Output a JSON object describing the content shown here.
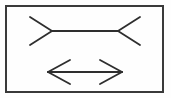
{
  "figure": {
    "background_color": "#fefefe",
    "frame": {
      "label": "rectangular border frame",
      "x": 6,
      "y": 6,
      "width": 157,
      "height": 86,
      "stroke_color": "#3a3a3a",
      "stroke_width": 2
    },
    "stroke_color": "#2e2e2e",
    "stroke_width": 1.8,
    "shapes": [
      {
        "name": "top-line-outward-fins",
        "description": "Horizontal line with fins pointing outward at both ends, appears shorter",
        "shaft": {
          "x1": 52,
          "y1": 31,
          "x2": 118,
          "y2": 31
        },
        "fins": [
          {
            "x1": 52,
            "y1": 31,
            "x2": 30,
            "y2": 17
          },
          {
            "x1": 52,
            "y1": 31,
            "x2": 30,
            "y2": 45
          },
          {
            "x1": 118,
            "y1": 31,
            "x2": 140,
            "y2": 17
          },
          {
            "x1": 118,
            "y1": 31,
            "x2": 140,
            "y2": 45
          }
        ]
      },
      {
        "name": "bottom-line-inward-fins",
        "description": "Double headed arrow with fins pointing inward at both ends, appears longer",
        "shaft": {
          "x1": 48,
          "y1": 72,
          "x2": 122,
          "y2": 72
        },
        "fins": [
          {
            "x1": 48,
            "y1": 72,
            "x2": 70,
            "y2": 60
          },
          {
            "x1": 48,
            "y1": 72,
            "x2": 70,
            "y2": 84
          },
          {
            "x1": 122,
            "y1": 72,
            "x2": 100,
            "y2": 60
          },
          {
            "x1": 122,
            "y1": 72,
            "x2": 100,
            "y2": 84
          }
        ]
      }
    ]
  }
}
